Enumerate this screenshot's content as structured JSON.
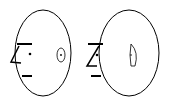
{
  "diagram": {
    "description": "Two head outlines in profile facing left, each with ear",
    "stroke_color": "#000000",
    "background": "#ffffff",
    "heads": [
      {
        "id": "head-left",
        "outline": {
          "cx": 43,
          "cy": 53,
          "rx": 28,
          "ry": 43
        },
        "brow_line": {
          "x1": 17,
          "y1": 44,
          "x2": 32,
          "y2": 44
        },
        "mouth_line": {
          "x1": 22,
          "y1": 76,
          "x2": 32,
          "y2": 76
        },
        "nose": "M19 46 L11 62 L21 63",
        "eye": {
          "cx": 30,
          "cy": 54,
          "r": 1.3
        },
        "ear": {
          "type": "ellipse",
          "cx": 61,
          "cy": 55,
          "rx": 4,
          "ry": 7,
          "dot": {
            "cx": 61,
            "cy": 55,
            "r": 0.9
          }
        }
      },
      {
        "id": "head-right",
        "outline": {
          "cx": 129,
          "cy": 53,
          "rx": 30,
          "ry": 43
        },
        "brow_line": {
          "x1": 88,
          "y1": 44,
          "x2": 103,
          "y2": 44
        },
        "mouth_line": {
          "x1": 91,
          "y1": 76,
          "x2": 101,
          "y2": 76
        },
        "nose": "M99 46 L87 66 L97 66",
        "eye": {
          "cx": 97,
          "cy": 55,
          "r": 1.3
        },
        "ear": {
          "type": "d-shape",
          "path": "M131 44 Q139 52 135 66 L131 66 Q129 55 131 44 Z",
          "dot": {
            "cx": 131,
            "cy": 55,
            "r": 0.8
          }
        }
      }
    ]
  }
}
